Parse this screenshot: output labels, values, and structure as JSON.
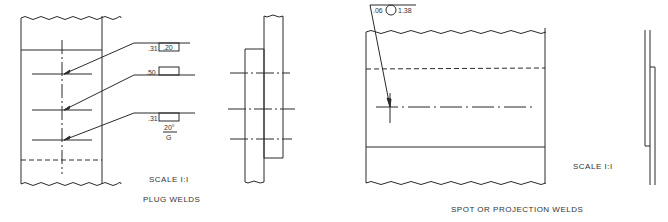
{
  "plug_welds": {
    "title": "PLUG WELDS",
    "scale": "SCALE I:I",
    "callouts": [
      {
        "size": ".31",
        "box_value": ".20"
      },
      {
        "size": ".50",
        "box_value": ""
      },
      {
        "size": ".31",
        "box_value": "",
        "angle": "20°",
        "finish": "G"
      }
    ]
  },
  "spot_welds": {
    "title": "SPOT OR PROJECTION WELDS",
    "scale": "SCALE I:I",
    "callout": {
      "size": ".06",
      "symbol": "circle",
      "pitch": "1.38"
    }
  },
  "colors": {
    "line": "#2a2a2a",
    "background": "#ffffff"
  }
}
